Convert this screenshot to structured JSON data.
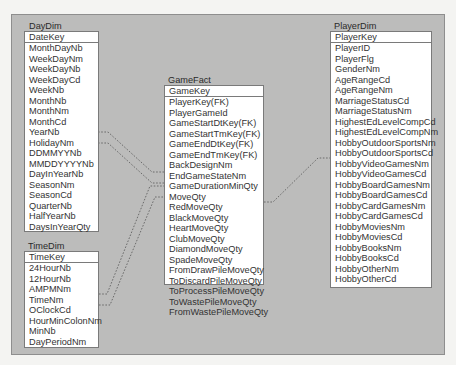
{
  "diagram": {
    "type": "star-schema",
    "entities": {
      "daydim": {
        "title": "DayDim",
        "key": "DateKey",
        "fields": [
          "MonthDayNb",
          "WeekDayNm",
          "WeekDayNb",
          "WeekDayCd",
          "WeekNb",
          "MonthNb",
          "MonthNm",
          "MonthCd",
          "YearNb",
          "HolidayNm",
          "DDMMYYNb",
          "MMDDYYYYNb",
          "DayInYearNb",
          "SeasonNm",
          "SeasonCd",
          "QuarterNb",
          "HalfYearNb",
          "DaysInYearQty"
        ]
      },
      "timedim": {
        "title": "TimeDim",
        "key": "TimeKey",
        "fields": [
          "24HourNb",
          "12HourNb",
          "AMPMNm",
          "TimeNm",
          "OClockCd",
          "HourMinColonNm",
          "MinNb",
          "DayPeriodNm"
        ]
      },
      "gamefact": {
        "title": "GameFact",
        "key": "GameKey",
        "fields": [
          "PlayerKey(FK)",
          "PlayerGameId",
          "GameStartDtKey(FK)",
          "GameStartTmKey(FK)",
          "GameEndDtKey(FK)",
          "GameEndTmKey(FK)",
          "BackDesignNm",
          "EndGameStateNm",
          "GameDurationMinQty",
          "MoveQty",
          "RedMoveQty",
          "BlackMoveQty",
          "HeartMoveQty",
          "ClubMoveQty",
          "DiamondMoveQty",
          "SpadeMoveQty",
          "FromDrawPileMoveQty",
          "ToDiscardPileMoveQty",
          "ToProcessPileMoveQty",
          "ToWastePileMoveQty",
          "FromWastePileMoveQty"
        ]
      },
      "playerdim": {
        "title": "PlayerDim",
        "key": "PlayerKey",
        "fields": [
          "PlayerID",
          "PlayerFlg",
          "GenderNm",
          "AgeRangeCd",
          "AgeRangeNm",
          "MarriageStatusCd",
          "MarriageStatusNm",
          "HighestEdLevelCompCd",
          "HighestEdLevelCompNm",
          "HobbyOutdoorSportsNm",
          "HobbyOutdoorSportsCd",
          "HobbyVideoGamesNm",
          "HobbyVideoGamesCd",
          "HobbyBoardGamesNm",
          "HobbyBoardGamesCd",
          "HobbyCardGamesNm",
          "HobbyCardGamesCd",
          "HobbyMoviesNm",
          "HobbyMoviesCd",
          "HobbyBooksNm",
          "HobbyBooksCd",
          "HobbyOtherNm",
          "HobbyOtherCd"
        ]
      }
    },
    "relationships": [
      {
        "from": "DayDim",
        "to": "GameFact",
        "via": "GameStartDtKey(FK)"
      },
      {
        "from": "DayDim",
        "to": "GameFact",
        "via": "GameEndDtKey(FK)"
      },
      {
        "from": "TimeDim",
        "to": "GameFact",
        "via": "GameStartTmKey(FK)"
      },
      {
        "from": "TimeDim",
        "to": "GameFact",
        "via": "GameEndTmKey(FK)"
      },
      {
        "from": "PlayerDim",
        "to": "GameFact",
        "via": "PlayerKey(FK)"
      }
    ],
    "colors": {
      "panel": "#bcbcbb",
      "box": "#ffffff",
      "border": "#7a7a7a",
      "link": "#555555"
    }
  }
}
